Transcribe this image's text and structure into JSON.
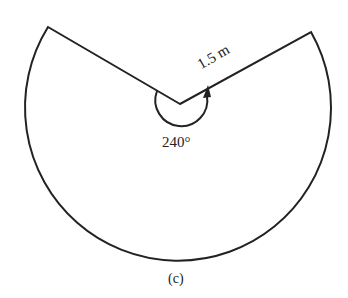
{
  "figure": {
    "radius_label": "1.5 m",
    "angle_label": "240°",
    "caption": "(c)",
    "stroke_color": "#222222"
  }
}
